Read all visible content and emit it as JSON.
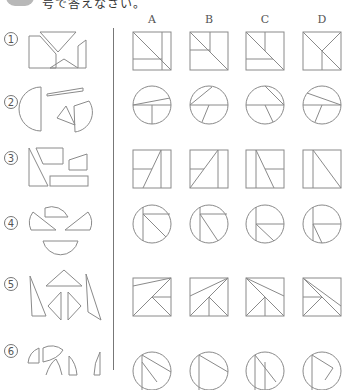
{
  "header": {
    "instruction_text": "号で答えなさい。"
  },
  "columns": [
    "A",
    "B",
    "C",
    "D"
  ],
  "questions": [
    {
      "number": "1",
      "shape_type": "square",
      "pieces": "trapezoid-triangle-set"
    },
    {
      "number": "2",
      "shape_type": "circle",
      "pieces": "circular-segment-set"
    },
    {
      "number": "3",
      "shape_type": "square",
      "pieces": "quadrilateral-set"
    },
    {
      "number": "4",
      "shape_type": "circle",
      "pieces": "circular-segment-set"
    },
    {
      "number": "5",
      "shape_type": "square",
      "pieces": "triangle-set"
    },
    {
      "number": "6",
      "shape_type": "circle",
      "pieces": "sector-set"
    }
  ],
  "colors": {
    "line": "#8a8a8a",
    "divider": "#777777",
    "badge": "#b8b8b8"
  }
}
